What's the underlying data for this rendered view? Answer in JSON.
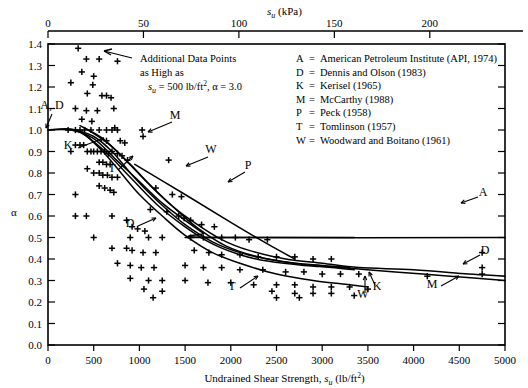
{
  "figure": {
    "top_axis_title": "s",
    "top_axis_title_sub": "u",
    "top_axis_title_unit": " (kPa)",
    "bottom_axis_title": "Undrained Shear Strength, ",
    "bottom_axis_title_sym": "s",
    "bottom_axis_title_sub": "u",
    "bottom_axis_title_unit": " (lb/ft",
    "bottom_axis_title_sup": "2",
    "bottom_axis_title_close": ")",
    "y_axis_title": "α"
  },
  "annotation": {
    "line1": "Additional Data Points",
    "line2": "as High as",
    "line3_sym": "s",
    "line3_sub": "u",
    "line3_rest": " = 500 lb/ft",
    "line3_sup": "2",
    "line3_tail": ", α = 3.0"
  },
  "legend": {
    "entries": [
      {
        "key": "A",
        "eq": "=",
        "text": "American Petroleum Institute (API, 1974)"
      },
      {
        "key": "D",
        "eq": "=",
        "text": "Dennis and Olson (1983)"
      },
      {
        "key": "K",
        "eq": "=",
        "text": "Kerisel (1965)"
      },
      {
        "key": "M",
        "eq": "=",
        "text": "McCarthy (1988)"
      },
      {
        "key": "P",
        "eq": "=",
        "text": "Peck (1958)"
      },
      {
        "key": "T",
        "eq": "=",
        "text": "Tomlinson (1957)"
      },
      {
        "key": "W",
        "eq": "=",
        "text": "Woodward and Boitano (1961)"
      }
    ]
  },
  "curve_labels": [
    {
      "id": "AD-left",
      "text": "A, D",
      "x": 52,
      "y": 109
    },
    {
      "id": "K-left",
      "text": "K",
      "x": 68,
      "y": 149
    },
    {
      "id": "M-upper",
      "text": "M",
      "x": 175,
      "y": 119
    },
    {
      "id": "T-left",
      "text": "T",
      "x": 112,
      "y": 172
    },
    {
      "id": "W-upper",
      "text": "W",
      "x": 211,
      "y": 153
    },
    {
      "id": "P-upper",
      "text": "P",
      "x": 248,
      "y": 169
    },
    {
      "id": "D-mid",
      "text": "D",
      "x": 130,
      "y": 227
    },
    {
      "id": "T-lower",
      "text": "T",
      "x": 232,
      "y": 290
    },
    {
      "id": "W-lower",
      "text": "W",
      "x": 363,
      "y": 298
    },
    {
      "id": "K-lower",
      "text": "K",
      "x": 377,
      "y": 290
    },
    {
      "id": "M-right",
      "text": "M",
      "x": 432,
      "y": 288
    },
    {
      "id": "A-right",
      "text": "A",
      "x": 483,
      "y": 196
    },
    {
      "id": "D-right",
      "text": "D",
      "x": 485,
      "y": 254
    }
  ],
  "chart_data": {
    "type": "scatter",
    "title": "",
    "xlabel": "Undrained Shear Strength, su (lb/ft2)",
    "ylabel": "α",
    "xlim": [
      0,
      5000
    ],
    "ylim": [
      0.0,
      1.4
    ],
    "grid": false,
    "legend_position": "top-right",
    "x_ticks": [
      0,
      500,
      1000,
      1500,
      2000,
      2500,
      3000,
      3500,
      4000,
      4500,
      5000
    ],
    "x_tick_labels": [
      "0",
      "500",
      "1000",
      "1500",
      "2000",
      "2500",
      "3000",
      "3500",
      "4000",
      "4500",
      "5000"
    ],
    "y_ticks": [
      0.0,
      0.1,
      0.2,
      0.3,
      0.4,
      0.5,
      0.6,
      0.7,
      0.8,
      0.9,
      1.0,
      1.1,
      1.2,
      1.3,
      1.4
    ],
    "y_tick_labels": [
      "0.0",
      "0.1",
      "0.2",
      "0.3",
      "0.4",
      "0.5",
      "0.6",
      "0.7",
      "0.8",
      "0.9",
      "1.0",
      "1.1",
      "1.2",
      "1.3",
      "1.4"
    ],
    "secondary_x_axis": {
      "label": "su (kPa)",
      "ticks": [
        0,
        50,
        100,
        150,
        200
      ],
      "tick_labels": [
        "0",
        "50",
        "100",
        "150",
        "200"
      ],
      "lim": [
        0,
        239.4
      ],
      "conversion": "1 kPa = 20.885 lb/ft2"
    },
    "marker": "+",
    "points": [
      [
        330,
        1.38
      ],
      [
        420,
        1.33
      ],
      [
        560,
        1.33
      ],
      [
        760,
        1.32
      ],
      [
        370,
        1.27
      ],
      [
        500,
        1.25
      ],
      [
        250,
        1.22
      ],
      [
        490,
        1.21
      ],
      [
        430,
        1.17
      ],
      [
        590,
        1.16
      ],
      [
        640,
        1.16
      ],
      [
        690,
        1.15
      ],
      [
        300,
        1.1
      ],
      [
        420,
        1.09
      ],
      [
        540,
        1.09
      ],
      [
        720,
        1.1
      ],
      [
        370,
        1.05
      ],
      [
        480,
        1.04
      ],
      [
        220,
        1.0
      ],
      [
        300,
        1.0
      ],
      [
        350,
        1.0
      ],
      [
        400,
        1.0
      ],
      [
        470,
        1.0
      ],
      [
        560,
        1.0
      ],
      [
        640,
        1.0
      ],
      [
        700,
        1.0
      ],
      [
        730,
        1.01
      ],
      [
        760,
        1.0
      ],
      [
        1030,
        1.0
      ],
      [
        1040,
        0.97
      ],
      [
        300,
        0.93
      ],
      [
        350,
        0.93
      ],
      [
        390,
        0.93
      ],
      [
        640,
        0.95
      ],
      [
        790,
        0.95
      ],
      [
        840,
        0.94
      ],
      [
        250,
        0.9
      ],
      [
        430,
        0.9
      ],
      [
        470,
        0.9
      ],
      [
        500,
        0.9
      ],
      [
        540,
        0.9
      ],
      [
        580,
        0.9
      ],
      [
        620,
        0.9
      ],
      [
        660,
        0.89
      ],
      [
        700,
        0.9
      ],
      [
        760,
        0.89
      ],
      [
        810,
        0.88
      ],
      [
        870,
        0.86
      ],
      [
        560,
        0.85
      ],
      [
        600,
        0.85
      ],
      [
        640,
        0.84
      ],
      [
        680,
        0.84
      ],
      [
        430,
        0.82
      ],
      [
        500,
        0.8
      ],
      [
        560,
        0.8
      ],
      [
        600,
        0.79
      ],
      [
        650,
        0.79
      ],
      [
        700,
        0.78
      ],
      [
        760,
        0.78
      ],
      [
        1320,
        0.86
      ],
      [
        300,
        0.7
      ],
      [
        560,
        0.74
      ],
      [
        620,
        0.73
      ],
      [
        680,
        0.72
      ],
      [
        720,
        0.71
      ],
      [
        1180,
        0.73
      ],
      [
        1360,
        0.7
      ],
      [
        1460,
        0.69
      ],
      [
        300,
        0.6
      ],
      [
        420,
        0.6
      ],
      [
        700,
        0.6
      ],
      [
        1120,
        0.63
      ],
      [
        1300,
        0.62
      ],
      [
        1430,
        0.6
      ],
      [
        1490,
        0.59
      ],
      [
        1560,
        0.58
      ],
      [
        860,
        0.58
      ],
      [
        920,
        0.55
      ],
      [
        980,
        0.54
      ],
      [
        1060,
        0.53
      ],
      [
        1680,
        0.56
      ],
      [
        1820,
        0.55
      ],
      [
        500,
        0.5
      ],
      [
        900,
        0.5
      ],
      [
        1100,
        0.5
      ],
      [
        1250,
        0.5
      ],
      [
        1560,
        0.5
      ],
      [
        1700,
        0.5
      ],
      [
        1900,
        0.5
      ],
      [
        2050,
        0.5
      ],
      [
        2200,
        0.49
      ],
      [
        2400,
        0.49
      ],
      [
        700,
        0.45
      ],
      [
        860,
        0.45
      ],
      [
        920,
        0.44
      ],
      [
        1040,
        0.43
      ],
      [
        1180,
        0.43
      ],
      [
        1600,
        0.44
      ],
      [
        1760,
        0.43
      ],
      [
        1900,
        0.42
      ],
      [
        2100,
        0.42
      ],
      [
        2300,
        0.41
      ],
      [
        2500,
        0.41
      ],
      [
        2700,
        0.41
      ],
      [
        2900,
        0.4
      ],
      [
        3100,
        0.4
      ],
      [
        4750,
        0.43
      ],
      [
        760,
        0.38
      ],
      [
        900,
        0.37
      ],
      [
        1020,
        0.36
      ],
      [
        1160,
        0.36
      ],
      [
        1500,
        0.37
      ],
      [
        1700,
        0.36
      ],
      [
        1900,
        0.36
      ],
      [
        2100,
        0.35
      ],
      [
        2350,
        0.35
      ],
      [
        2600,
        0.34
      ],
      [
        2800,
        0.34
      ],
      [
        3000,
        0.33
      ],
      [
        3200,
        0.33
      ],
      [
        3400,
        0.33
      ],
      [
        4750,
        0.36
      ],
      [
        4750,
        0.33
      ],
      [
        4150,
        0.32
      ],
      [
        900,
        0.31
      ],
      [
        1100,
        0.3
      ],
      [
        1250,
        0.3
      ],
      [
        1500,
        0.3
      ],
      [
        1750,
        0.29
      ],
      [
        2000,
        0.29
      ],
      [
        2250,
        0.28
      ],
      [
        2500,
        0.28
      ],
      [
        2700,
        0.28
      ],
      [
        2900,
        0.27
      ],
      [
        3100,
        0.27
      ],
      [
        3300,
        0.27
      ],
      [
        3500,
        0.26
      ],
      [
        1050,
        0.26
      ],
      [
        1250,
        0.25
      ],
      [
        2450,
        0.25
      ],
      [
        2700,
        0.24
      ],
      [
        2900,
        0.24
      ],
      [
        3100,
        0.24
      ],
      [
        3350,
        0.23
      ],
      [
        1150,
        0.22
      ],
      [
        2500,
        0.22
      ],
      [
        2750,
        0.22
      ]
    ],
    "curves": [
      {
        "id": "A",
        "label": "A",
        "source": "American Petroleum Institute (API, 1974)",
        "points": [
          [
            0,
            1.0
          ],
          [
            250,
            1.0
          ],
          [
            500,
            0.96
          ],
          [
            750,
            0.86
          ],
          [
            1000,
            0.76
          ],
          [
            1250,
            0.66
          ],
          [
            1500,
            0.58
          ],
          [
            1600,
            0.55
          ],
          [
            1700,
            0.52
          ],
          [
            1800,
            0.5
          ],
          [
            5000,
            0.5
          ]
        ]
      },
      {
        "id": "D",
        "label": "D",
        "source": "Dennis and Olson (1983)",
        "points": [
          [
            0,
            1.0
          ],
          [
            300,
            1.0
          ],
          [
            600,
            0.91
          ],
          [
            900,
            0.78
          ],
          [
            1200,
            0.65
          ],
          [
            1500,
            0.55
          ],
          [
            1800,
            0.47
          ],
          [
            2100,
            0.42
          ],
          [
            2400,
            0.39
          ],
          [
            2800,
            0.37
          ],
          [
            3200,
            0.36
          ],
          [
            3800,
            0.34
          ],
          [
            4400,
            0.32
          ],
          [
            5000,
            0.3
          ]
        ]
      },
      {
        "id": "K",
        "label": "K",
        "source": "Kerisel (1965)",
        "points": [
          [
            300,
            1.0
          ],
          [
            500,
            0.97
          ],
          [
            700,
            0.9
          ],
          [
            900,
            0.8
          ],
          [
            1100,
            0.71
          ],
          [
            1300,
            0.63
          ],
          [
            1500,
            0.56
          ],
          [
            1800,
            0.48
          ],
          [
            2100,
            0.43
          ],
          [
            2400,
            0.4
          ],
          [
            2700,
            0.38
          ],
          [
            3000,
            0.37
          ],
          [
            3300,
            0.36
          ]
        ]
      },
      {
        "id": "M",
        "label": "M",
        "source": "McCarthy (1988)",
        "points": [
          [
            350,
            1.02
          ],
          [
            600,
            0.96
          ],
          [
            850,
            0.86
          ],
          [
            1100,
            0.75
          ],
          [
            1350,
            0.65
          ],
          [
            1600,
            0.57
          ],
          [
            1900,
            0.49
          ],
          [
            2200,
            0.44
          ],
          [
            2600,
            0.4
          ],
          [
            3000,
            0.38
          ],
          [
            3400,
            0.36
          ],
          [
            4000,
            0.35
          ],
          [
            4600,
            0.33
          ],
          [
            5000,
            0.32
          ]
        ]
      },
      {
        "id": "P",
        "label": "P",
        "source": "Peck (1958)",
        "points": [
          [
            950,
            0.84
          ],
          [
            1500,
            0.7
          ],
          [
            2000,
            0.57
          ],
          [
            2400,
            0.47
          ],
          [
            2700,
            0.4
          ]
        ]
      },
      {
        "id": "T",
        "label": "T",
        "source": "Tomlinson (1957)",
        "points": [
          [
            380,
            0.99
          ],
          [
            600,
            0.9
          ],
          [
            800,
            0.8
          ],
          [
            1000,
            0.7
          ],
          [
            1250,
            0.6
          ],
          [
            1500,
            0.51
          ],
          [
            1800,
            0.43
          ],
          [
            2100,
            0.38
          ],
          [
            2500,
            0.33
          ],
          [
            2900,
            0.3
          ],
          [
            3300,
            0.28
          ],
          [
            3500,
            0.27
          ]
        ]
      },
      {
        "id": "W",
        "label": "W",
        "source": "Woodward and Boitano (1961)",
        "points": [
          [
            400,
            1.01
          ],
          [
            650,
            0.94
          ],
          [
            900,
            0.84
          ],
          [
            1150,
            0.73
          ],
          [
            1400,
            0.63
          ],
          [
            1650,
            0.54
          ],
          [
            1950,
            0.46
          ],
          [
            2300,
            0.41
          ],
          [
            2700,
            0.38
          ],
          [
            3100,
            0.36
          ],
          [
            3350,
            0.35
          ]
        ]
      },
      {
        "id": "H",
        "label": "",
        "source": "horizontal segment",
        "points": [
          [
            1500,
            0.5
          ],
          [
            3350,
            0.5
          ]
        ]
      }
    ]
  }
}
